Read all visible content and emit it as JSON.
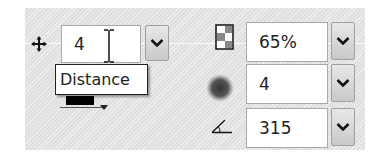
{
  "left_group": {
    "distance": {
      "value": "4",
      "tooltip": "Distance",
      "icon": "move-icon"
    },
    "color_swatch": {
      "color": "#000000"
    }
  },
  "right_group": {
    "opacity": {
      "value": "65%",
      "icon": "opacity-checker-icon"
    },
    "size": {
      "value": "4",
      "icon": "blur-size-icon"
    },
    "angle": {
      "value": "315",
      "icon": "angle-icon"
    }
  },
  "colors": {
    "panel_bg": "#e6e6e6",
    "field_border": "#a9a9a9",
    "dropdown_bg": "#d0d0d0"
  }
}
